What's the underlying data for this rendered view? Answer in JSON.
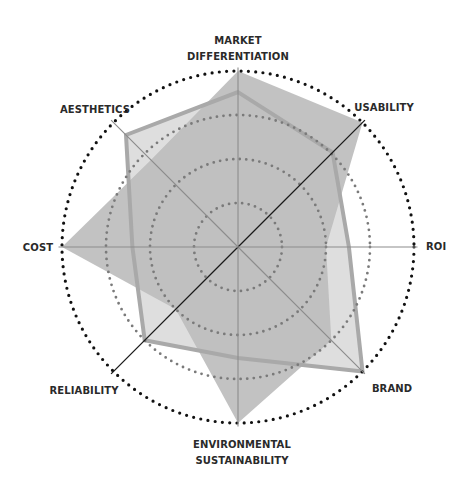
{
  "chart_data": {
    "type": "radar",
    "title": "",
    "axes": [
      "MARKET DIFFERENTIATION",
      "USABILITY",
      "ROI",
      "BRAND",
      "ENVIRONMENTAL SUSTAINABILITY",
      "RELIABILITY",
      "COST",
      "AESTHETICS"
    ],
    "axis_label_lines": [
      [
        "MARKET",
        "DIFFERENTIATION"
      ],
      [
        "USABILITY"
      ],
      [
        "ROI"
      ],
      [
        "BRAND"
      ],
      [
        "ENVIRONMENTAL",
        "SUSTAINABILITY"
      ],
      [
        "RELIABILITY"
      ],
      [
        "COST"
      ],
      [
        "AESTHETICS"
      ]
    ],
    "range": [
      0,
      1
    ],
    "rings": [
      0.25,
      0.5,
      0.75,
      1.0
    ],
    "grid": "dotted-circles",
    "legend": null,
    "highlighted_axes": [
      "USABILITY",
      "RELIABILITY"
    ],
    "series": [
      {
        "name": "Series A (solid fill)",
        "style": "filled",
        "fill": "#bdbdbd",
        "values": [
          1.0,
          1.0,
          0.5,
          0.75,
          1.0,
          0.5,
          1.0,
          0.7
        ]
      },
      {
        "name": "Series B (outlined)",
        "style": "outlined",
        "fill": "#dedede",
        "stroke": "#a9a9a9",
        "values": [
          0.88,
          0.76,
          0.63,
          1.0,
          0.63,
          0.75,
          0.6,
          0.9
        ]
      }
    ]
  },
  "colors": {
    "background": "#ffffff",
    "axis_line": "#8c8c8c",
    "highlight_axis_line": "#1a1a1a",
    "ring_outer": "#111111",
    "ring_inner": "#7a7a7a",
    "label_text": "#2a2a2a"
  }
}
